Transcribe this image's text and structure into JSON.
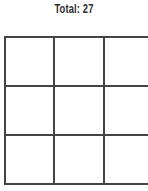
{
  "header": {
    "title": "Total: 27"
  },
  "grid": {
    "rows": 3,
    "cols": 3,
    "line_color": "#444444",
    "cells": [
      [
        "",
        "",
        ""
      ],
      [
        "",
        "",
        ""
      ],
      [
        "",
        "",
        ""
      ]
    ]
  }
}
